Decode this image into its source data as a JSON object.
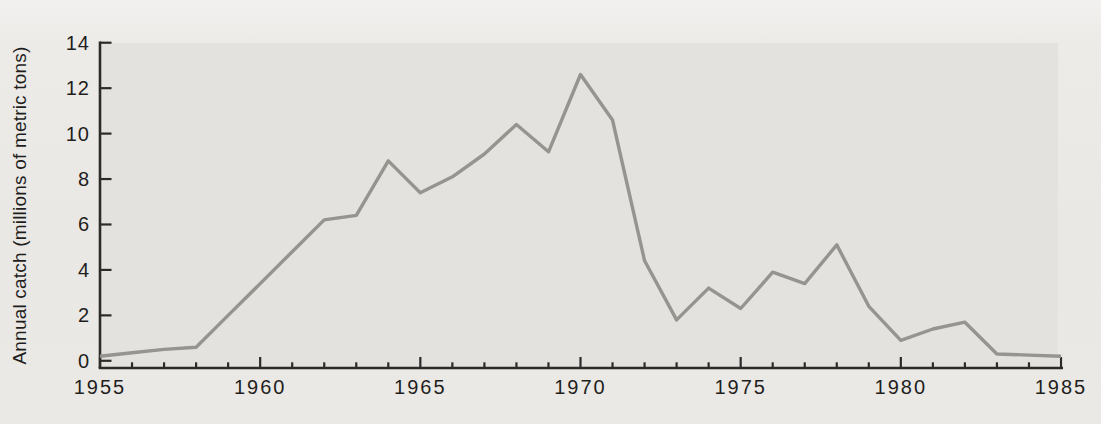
{
  "figure": {
    "background_color": "#eae9e6",
    "plot_background_color": "#e3e2df"
  },
  "chart_data": {
    "type": "line",
    "title": "",
    "xlabel": "",
    "ylabel": "Annual catch (millions of metric tons)",
    "x": [
      1955,
      1956,
      1957,
      1958,
      1959,
      1960,
      1961,
      1962,
      1963,
      1964,
      1965,
      1966,
      1967,
      1968,
      1969,
      1970,
      1971,
      1972,
      1973,
      1974,
      1975,
      1976,
      1977,
      1978,
      1979,
      1980,
      1981,
      1982,
      1983,
      1984,
      1985
    ],
    "series": [
      {
        "name": "Annual catch",
        "values": [
          0.2,
          0.35,
          0.5,
          0.6,
          2.0,
          3.4,
          4.8,
          6.2,
          6.4,
          8.8,
          7.4,
          8.1,
          9.1,
          10.4,
          9.2,
          12.6,
          10.6,
          4.4,
          1.8,
          3.2,
          2.3,
          3.9,
          3.4,
          5.1,
          2.4,
          0.9,
          1.4,
          1.7,
          0.3,
          0.25,
          0.2
        ]
      }
    ],
    "xlim": [
      1955,
      1985
    ],
    "ylim": [
      0,
      14
    ],
    "x_major_ticks": [
      1955,
      1960,
      1965,
      1970,
      1975,
      1980,
      1985
    ],
    "x_tick_labels": [
      "1955",
      "1960",
      "1965",
      "1970",
      "1975",
      "1980",
      "1985"
    ],
    "x_minor_tick_step": 1,
    "y_ticks": [
      0,
      2,
      4,
      6,
      8,
      10,
      12,
      14
    ],
    "y_tick_labels": [
      "0",
      "2",
      "4",
      "6",
      "8",
      "10",
      "12",
      "14"
    ],
    "grid": false,
    "legend": "none",
    "colors": {
      "line": "#95948f",
      "axis": "#2c2b29",
      "text": "#1f1e1c",
      "plot_bg": "#e3e2df"
    }
  }
}
